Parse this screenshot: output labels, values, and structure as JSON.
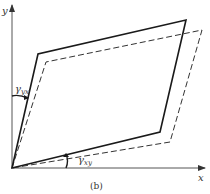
{
  "figure": {
    "caption": "(b)",
    "axes": {
      "x_label": "x",
      "y_label": "y",
      "origin": [
        12,
        168
      ],
      "x_end": [
        206,
        168
      ],
      "y_end": [
        12,
        4
      ]
    },
    "shapes": {
      "solid_parallelogram": {
        "style": "solid",
        "points": [
          [
            12,
            168
          ],
          [
            38,
            54
          ],
          [
            186,
            20
          ],
          [
            160,
            132
          ]
        ]
      },
      "dashed_parallelogram": {
        "style": "dashed",
        "points": [
          [
            12,
            168
          ],
          [
            46,
            62
          ],
          [
            202,
            30
          ],
          [
            170,
            142
          ]
        ]
      }
    },
    "angles": {
      "gamma_yx": {
        "symbol": "γ",
        "subscript": "yx",
        "label_pos": [
          16,
          92
        ]
      },
      "gamma_xy": {
        "symbol": "γ",
        "subscript": "xy",
        "label_pos": [
          80,
          162
        ]
      }
    },
    "colors": {
      "solid_line": "#1a1a1a",
      "dashed_line": "#333333",
      "axis": "#555555",
      "background": "#ffffff"
    }
  }
}
